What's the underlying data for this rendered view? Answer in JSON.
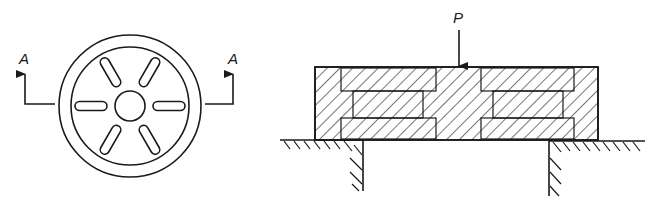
{
  "figure": {
    "type": "engineering-drawing",
    "plan_view": {
      "section_label_left": "A",
      "section_label_right": "A",
      "slot_count": 6,
      "description": "Circular plate with central hole and six radial slots"
    },
    "section_view": {
      "load_label": "P",
      "description": "Section A-A: stacked slotted plates resting on supports, loaded by central force P"
    },
    "colors": {
      "line": "#1a1a1a",
      "background": "#ffffff"
    }
  }
}
